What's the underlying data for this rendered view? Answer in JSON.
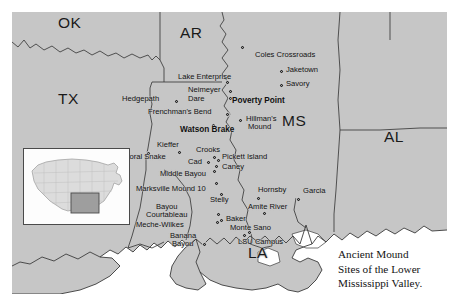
{
  "map": {
    "title_caption": "Ancient Mound Sites of the Lower Mississippi Valley.",
    "caption_lines": [
      "Ancient Mound",
      "Sites of the Lower",
      "Mississippi Valley."
    ],
    "background_color": "#ffffff",
    "land_color": "#c6c6c6",
    "water_color": "#ffffff",
    "border_color": "#3a3a3a",
    "marker_color": "#2b2b2b",
    "label_color": "#111111"
  },
  "states": [
    {
      "abbr": "OK",
      "x": 70,
      "y": 22
    },
    {
      "abbr": "AR",
      "x": 190,
      "y": 30
    },
    {
      "abbr": "TX",
      "x": 68,
      "y": 96
    },
    {
      "abbr": "MS",
      "x": 292,
      "y": 118
    },
    {
      "abbr": "AL",
      "x": 392,
      "y": 133
    },
    {
      "abbr": "LA",
      "x": 255,
      "y": 250
    }
  ],
  "sites": [
    {
      "name": "Coles Crossroads",
      "lx": 255,
      "ly": 55,
      "mx": 240,
      "my": 45,
      "anchor": "left",
      "bold": false
    },
    {
      "name": "Lake Enterprise",
      "lx": 178,
      "ly": 73,
      "mx": 225,
      "my": 80,
      "anchor": "left",
      "bold": false
    },
    {
      "name": "Jaketown",
      "lx": 286,
      "ly": 70,
      "mx": 279,
      "my": 72,
      "anchor": "left",
      "bold": false
    },
    {
      "name": "Savory",
      "lx": 286,
      "ly": 84,
      "mx": 279,
      "my": 86,
      "anchor": "left",
      "bold": false
    },
    {
      "name": "Neimeyer",
      "lx": 190,
      "ly": 88,
      "mx": 228,
      "my": 90,
      "anchor": "left",
      "bold": false
    },
    {
      "name": "Dare",
      "lx": 190,
      "ly": 97,
      "mx": 228,
      "my": 97,
      "anchor": "left",
      "bold": false
    },
    {
      "name": "Hedgepath",
      "lx": 121,
      "ly": 97,
      "mx": 174,
      "my": 99,
      "anchor": "left",
      "bold": false
    },
    {
      "name": "Poverty Point",
      "lx": 232,
      "ly": 100,
      "mx": 228,
      "my": 96,
      "anchor": "left",
      "bold": true
    },
    {
      "name": "Frenchman's Bend",
      "lx": 148,
      "ly": 110,
      "mx": 225,
      "my": 113,
      "anchor": "left",
      "bold": false
    },
    {
      "name": "Hillman's",
      "lx": 246,
      "ly": 117,
      "mx": 238,
      "my": 119,
      "anchor": "left",
      "bold": false
    },
    {
      "name": "Mound",
      "lx": 248,
      "ly": 126,
      "mx": null,
      "my": null,
      "anchor": "left",
      "bold": false
    },
    {
      "name": "Watson Brake",
      "lx": 182,
      "ly": 128,
      "mx": 211,
      "my": 124,
      "anchor": "left",
      "bold": true
    },
    {
      "name": "Kieffer",
      "lx": 157,
      "ly": 143,
      "mx": 177,
      "my": 151,
      "anchor": "left",
      "bold": false
    },
    {
      "name": "Crooks",
      "lx": 199,
      "ly": 148,
      "mx": 212,
      "my": 156,
      "anchor": "left",
      "bold": false
    },
    {
      "name": "Pickett Island",
      "lx": 222,
      "ly": 157,
      "mx": 216,
      "my": 159,
      "anchor": "left",
      "bold": false
    },
    {
      "name": "Coral Snake",
      "lx": 127,
      "ly": 155,
      "mx": 146,
      "my": 152,
      "anchor": "left",
      "bold": false
    },
    {
      "name": "Cad",
      "lx": 186,
      "ly": 159,
      "mx": 206,
      "my": 161,
      "anchor": "left",
      "bold": false
    },
    {
      "name": "Caney",
      "lx": 222,
      "ly": 166,
      "mx": 214,
      "my": 165,
      "anchor": "left",
      "bold": false
    },
    {
      "name": "Middle Bayou",
      "lx": 163,
      "ly": 172,
      "mx": 212,
      "my": 170,
      "anchor": "left",
      "bold": false
    },
    {
      "name": "Marksville Mound 10",
      "lx": 137,
      "ly": 187,
      "mx": 214,
      "my": 182,
      "anchor": "left",
      "bold": false
    },
    {
      "name": "Hornsby",
      "lx": 259,
      "ly": 189,
      "mx": 256,
      "my": 197,
      "anchor": "left",
      "bold": false
    },
    {
      "name": "Garcia",
      "lx": 305,
      "ly": 191,
      "mx": 296,
      "my": 198,
      "anchor": "left",
      "bold": false
    },
    {
      "name": "Stelly",
      "lx": 212,
      "ly": 199,
      "mx": 219,
      "my": 193,
      "anchor": "left",
      "bold": false
    },
    {
      "name": "Bayou",
      "lx": 157,
      "ly": 204,
      "mx": null,
      "my": null,
      "anchor": "left",
      "bold": false
    },
    {
      "name": "Amite River",
      "lx": 251,
      "ly": 205,
      "mx": 262,
      "my": 212,
      "anchor": "left",
      "bold": false
    },
    {
      "name": "Courtableau",
      "lx": 148,
      "ly": 213,
      "mx": 216,
      "my": 213,
      "anchor": "left",
      "bold": false
    },
    {
      "name": "Baker",
      "lx": 227,
      "ly": 218,
      "mx": 219,
      "my": 219,
      "anchor": "left",
      "bold": false
    },
    {
      "name": "Meche-Wilkes",
      "lx": 137,
      "ly": 224,
      "mx": 215,
      "my": 221,
      "anchor": "left",
      "bold": false
    },
    {
      "name": "Monte Sano",
      "lx": 232,
      "ly": 226,
      "mx": 247,
      "my": 231,
      "anchor": "left",
      "bold": false
    },
    {
      "name": "Banana",
      "lx": 171,
      "ly": 234,
      "mx": null,
      "my": null,
      "anchor": "left",
      "bold": false
    },
    {
      "name": "Bayou",
      "lx": 173,
      "ly": 243,
      "mx": 202,
      "my": 243,
      "anchor": "left",
      "bold": false
    },
    {
      "name": "LSU Campus",
      "lx": 240,
      "ly": 240,
      "mx": 242,
      "my": 234,
      "anchor": "left",
      "bold": false
    }
  ],
  "inset": {
    "name": "united-states-locator-map",
    "highlight_region": "lower-mississippi-valley"
  }
}
